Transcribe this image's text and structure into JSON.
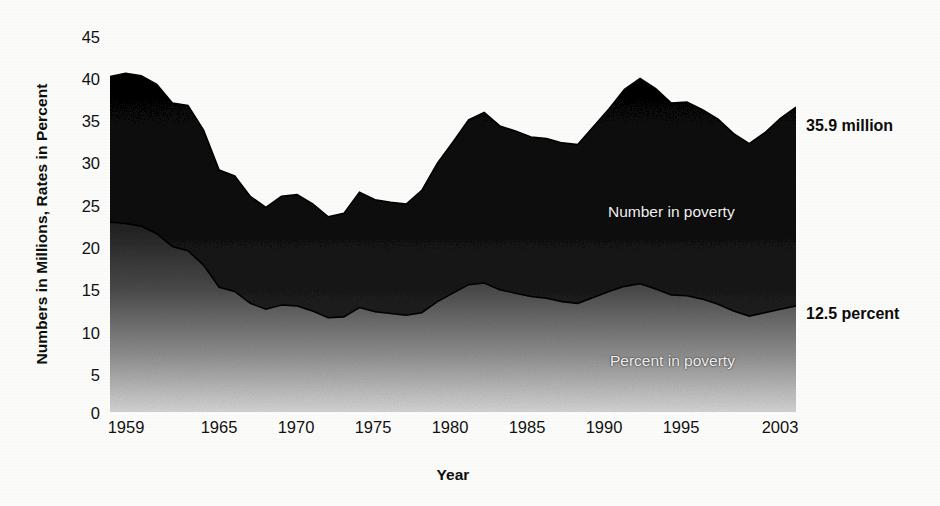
{
  "chart_data": {
    "type": "area",
    "title": "",
    "xlabel": "Year",
    "ylabel": "Numbers in Millions, Rates in Percent",
    "xlim": [
      1959,
      2003
    ],
    "ylim": [
      0,
      45
    ],
    "grid": false,
    "legend_position": "inline-labels",
    "yticks": [
      "45",
      "40",
      "35",
      "30",
      "25",
      "20",
      "15",
      "10",
      "5",
      "0"
    ],
    "ytick_values": [
      45,
      40,
      35,
      30,
      25,
      20,
      15,
      10,
      5,
      0
    ],
    "xticks": [
      "1959",
      "1965",
      "1970",
      "1975",
      "1980",
      "1985",
      "1990",
      "1995",
      "2003"
    ],
    "xtick_values": [
      1959,
      1965,
      1970,
      1975,
      1980,
      1985,
      1990,
      1995,
      2003
    ],
    "x": [
      1959,
      1960,
      1961,
      1962,
      1963,
      1964,
      1965,
      1966,
      1967,
      1968,
      1969,
      1970,
      1971,
      1972,
      1973,
      1974,
      1975,
      1976,
      1977,
      1978,
      1979,
      1980,
      1981,
      1982,
      1983,
      1984,
      1985,
      1986,
      1987,
      1988,
      1989,
      1990,
      1991,
      1992,
      1993,
      1994,
      1995,
      1996,
      1997,
      1998,
      1999,
      2000,
      2001,
      2002,
      2003
    ],
    "series": [
      {
        "name": "Number in poverty",
        "units": "millions",
        "fill": "dark-gradient",
        "values": [
          39.5,
          39.9,
          39.6,
          38.6,
          36.4,
          36.1,
          33.2,
          28.5,
          27.8,
          25.4,
          24.1,
          25.4,
          25.6,
          24.5,
          23.0,
          23.4,
          25.9,
          25.0,
          24.7,
          24.5,
          26.1,
          29.3,
          31.8,
          34.4,
          35.3,
          33.7,
          33.1,
          32.4,
          32.2,
          31.7,
          31.5,
          33.6,
          35.7,
          38.0,
          39.3,
          38.1,
          36.4,
          36.5,
          35.6,
          34.5,
          32.8,
          31.6,
          32.9,
          34.6,
          35.9
        ],
        "endpoint_label": "35.9 million",
        "inline_label": "Number in poverty"
      },
      {
        "name": "Percent in poverty",
        "units": "percent",
        "fill": "mid-gradient",
        "values": [
          22.4,
          22.2,
          21.9,
          21.0,
          19.5,
          19.0,
          17.3,
          14.7,
          14.2,
          12.8,
          12.1,
          12.6,
          12.5,
          11.9,
          11.1,
          11.2,
          12.3,
          11.8,
          11.6,
          11.4,
          11.7,
          13.0,
          14.0,
          15.0,
          15.2,
          14.4,
          14.0,
          13.6,
          13.4,
          13.0,
          12.8,
          13.5,
          14.2,
          14.8,
          15.1,
          14.5,
          13.8,
          13.7,
          13.3,
          12.7,
          11.9,
          11.3,
          11.7,
          12.1,
          12.5
        ],
        "endpoint_label": "12.5 percent",
        "inline_label": "Percent in poverty"
      }
    ],
    "annotations": [
      {
        "text": "35.9 million",
        "x": 2003,
        "y": 35.9
      },
      {
        "text": "12.5 percent",
        "x": 2003,
        "y": 12.5
      }
    ]
  },
  "colors": {
    "number_area_top": "#050505",
    "number_area_bottom": "#2e2e2e",
    "percent_area_top": "#2a2a2a",
    "percent_area_bottom": "#cfcfcf",
    "axis": "#111111",
    "page": "#fbfbf9",
    "inline_label_text": "#efefef",
    "annotation_text": "#0b0b0b"
  }
}
